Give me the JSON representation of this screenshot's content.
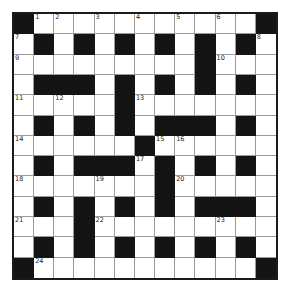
{
  "puzzle": {
    "type": "crossword",
    "rows": 13,
    "cols": 13,
    "colors": {
      "block": "#141414",
      "cell": "#ffffff",
      "border": "#1a1a1a",
      "gridline": "#9a9a9a"
    },
    "layout": [
      "#...........#",
      ".#.#.#.#.#.#.",
      ".........#...",
      ".###.#.#.#.#.",
      ".....#.......",
      ".#.#.#.###.#.",
      "......#......",
      ".#.###.#.#.#.",
      ".......#.....",
      ".#.#.#.#.###.",
      "...#.........",
      ".#.#.#.#.#.#.",
      "#...........#"
    ],
    "numbers": [
      {
        "row": 0,
        "col": 1,
        "n": "1"
      },
      {
        "row": 0,
        "col": 2,
        "n": "2"
      },
      {
        "row": 0,
        "col": 4,
        "n": "3"
      },
      {
        "row": 0,
        "col": 6,
        "n": "4"
      },
      {
        "row": 0,
        "col": 8,
        "n": "5"
      },
      {
        "row": 0,
        "col": 10,
        "n": "6"
      },
      {
        "row": 1,
        "col": 0,
        "n": "7"
      },
      {
        "row": 1,
        "col": 12,
        "n": "8"
      },
      {
        "row": 2,
        "col": 0,
        "n": "9"
      },
      {
        "row": 2,
        "col": 10,
        "n": "10"
      },
      {
        "row": 4,
        "col": 0,
        "n": "11"
      },
      {
        "row": 4,
        "col": 2,
        "n": "12"
      },
      {
        "row": 4,
        "col": 6,
        "n": "13"
      },
      {
        "row": 6,
        "col": 0,
        "n": "14"
      },
      {
        "row": 6,
        "col": 7,
        "n": "15"
      },
      {
        "row": 6,
        "col": 8,
        "n": "16"
      },
      {
        "row": 7,
        "col": 6,
        "n": "17"
      },
      {
        "row": 8,
        "col": 0,
        "n": "18"
      },
      {
        "row": 8,
        "col": 4,
        "n": "19"
      },
      {
        "row": 8,
        "col": 8,
        "n": "20"
      },
      {
        "row": 10,
        "col": 0,
        "n": "21"
      },
      {
        "row": 10,
        "col": 4,
        "n": "22"
      },
      {
        "row": 10,
        "col": 10,
        "n": "23"
      },
      {
        "row": 12,
        "col": 1,
        "n": "24"
      }
    ]
  }
}
